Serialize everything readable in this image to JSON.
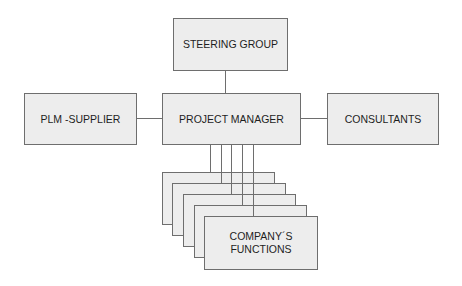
{
  "diagram": {
    "type": "organization-chart",
    "nodes": {
      "steering_group": "STEERING GROUP",
      "plm_supplier": "PLM -SUPPLIER",
      "project_manager": "PROJECT MANAGER",
      "consultants": "CONSULTANTS",
      "company_functions": "COMPANY´S\nFUNCTIONS"
    },
    "company_functions_stack_count": 5,
    "edges": [
      {
        "from": "steering_group",
        "to": "project_manager"
      },
      {
        "from": "plm_supplier",
        "to": "project_manager"
      },
      {
        "from": "project_manager",
        "to": "consultants"
      },
      {
        "from": "project_manager",
        "to": "company_functions_1"
      },
      {
        "from": "project_manager",
        "to": "company_functions_2"
      },
      {
        "from": "project_manager",
        "to": "company_functions_3"
      },
      {
        "from": "project_manager",
        "to": "company_functions_4"
      },
      {
        "from": "project_manager",
        "to": "company_functions_5"
      }
    ],
    "colors": {
      "box_fill": "#ededed",
      "box_border": "#6e6e6e",
      "text": "#1e1e1e",
      "background": "#ffffff"
    }
  }
}
